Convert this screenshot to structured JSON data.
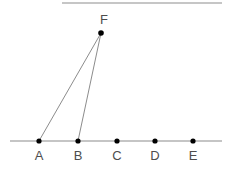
{
  "figure": {
    "canvas": {
      "width": 230,
      "height": 171,
      "background": "#ffffff"
    },
    "colors": {
      "line": "#8c8c8c",
      "segment": "#8c8c8c",
      "point": "#000000",
      "label": "#4d4d4d",
      "top_rule": "#b3b3b3"
    },
    "baseline": {
      "name": "horizontal-line",
      "y": 141,
      "x_start": 10,
      "x_end": 222,
      "stroke_width": 1.1
    },
    "top_rule": {
      "name": "top-rule",
      "y": 3,
      "x_start": 62,
      "x_end": 222,
      "stroke_width": 1.6
    },
    "points": [
      {
        "id": "A",
        "label": "A",
        "x": 39,
        "y": 141,
        "label_x": 39,
        "label_y": 160,
        "radius": 2.6
      },
      {
        "id": "B",
        "label": "B",
        "x": 78,
        "y": 141,
        "label_x": 78,
        "label_y": 160,
        "radius": 2.6
      },
      {
        "id": "C",
        "label": "C",
        "x": 117,
        "y": 141,
        "label_x": 117,
        "label_y": 160,
        "radius": 2.6
      },
      {
        "id": "D",
        "label": "D",
        "x": 155,
        "y": 141,
        "label_x": 155,
        "label_y": 160,
        "radius": 2.6
      },
      {
        "id": "E",
        "label": "E",
        "x": 193,
        "y": 141,
        "label_x": 193,
        "label_y": 160,
        "radius": 2.6
      },
      {
        "id": "F",
        "label": "F",
        "x": 101,
        "y": 33,
        "label_x": 104,
        "label_y": 24,
        "radius": 2.8
      }
    ],
    "segments": [
      {
        "id": "AF",
        "from": "A",
        "to": "F",
        "x1": 39,
        "y1": 141,
        "x2": 101,
        "y2": 33,
        "stroke_width": 1.0
      },
      {
        "id": "BF",
        "from": "B",
        "to": "F",
        "x1": 78,
        "y1": 141,
        "x2": 101,
        "y2": 33,
        "stroke_width": 1.0
      }
    ]
  }
}
